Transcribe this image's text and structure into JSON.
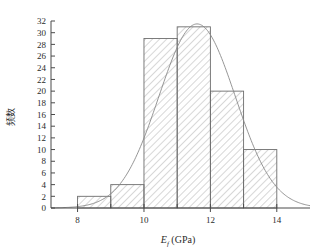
{
  "chart_data": {
    "type": "bar",
    "title": "",
    "subtitle": "",
    "xlabel": "E_f (GPa)",
    "xlabel_main": "E",
    "xlabel_sub": "f",
    "xlabel_unit": "(GPa)",
    "ylabel": "频数",
    "bin_edges": [
      8,
      9,
      10,
      11,
      12,
      13,
      14
    ],
    "categories": [
      "8-9",
      "9-10",
      "10-11",
      "11-12",
      "12-13",
      "13-14"
    ],
    "values": [
      2,
      4,
      29,
      31,
      20,
      10
    ],
    "xlim": [
      7.2,
      15.0
    ],
    "ylim": [
      0,
      32
    ],
    "xticks": [
      8,
      10,
      12,
      14
    ],
    "xtick_labels": [
      "8",
      "10",
      "12",
      "14"
    ],
    "yticks": [
      0,
      2,
      4,
      6,
      8,
      10,
      12,
      14,
      16,
      18,
      20,
      22,
      24,
      26,
      28,
      30,
      32
    ],
    "ytick_labels": [
      "0",
      "2",
      "4",
      "6",
      "8",
      "10",
      "12",
      "14",
      "16",
      "18",
      "20",
      "22",
      "24",
      "26",
      "28",
      "30",
      "32"
    ],
    "grid": false,
    "legend": null,
    "bar_fill": "hatch-diagonal",
    "bar_edge_color": "#6e6e6e",
    "overlay": {
      "type": "line",
      "name": "normal-distribution-fit",
      "color": "#8a8a8a",
      "mean": 11.6,
      "sigma": 1.15,
      "peak": 31.5
    },
    "annotations": []
  },
  "colors": {
    "axis": "#4a4a4a",
    "text": "#2b2b2b",
    "bar_edge": "#6e6e6e",
    "curve": "#8a8a8a",
    "background": "#ffffff"
  }
}
